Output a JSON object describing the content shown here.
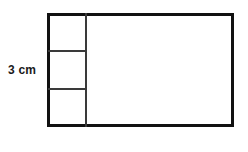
{
  "figure": {
    "type": "geometry-diagram",
    "background_color": "#ffffff",
    "stroke_color": "#111111",
    "interior_stroke_color": "#3a3a3a",
    "outer_border_width_px": 3,
    "interior_line_width_px": 2
  },
  "labels": {
    "height_label": "3 cm"
  },
  "shapes": {
    "main_rectangle": {
      "name": "main-rectangle",
      "x": 47,
      "y": 13,
      "width": 187,
      "height": 114
    },
    "column_divider": {
      "name": "column-divider",
      "orientation": "vertical",
      "x": 85,
      "y_start": 13,
      "y_end": 127
    },
    "cell_dividers": [
      {
        "name": "cell-divider-1",
        "orientation": "horizontal",
        "y": 50,
        "x_start": 48,
        "x_end": 86
      },
      {
        "name": "cell-divider-2",
        "orientation": "horizontal",
        "y": 88,
        "x_start": 48,
        "x_end": 86
      }
    ]
  },
  "regions": {
    "left_column_cells": 3,
    "right_region_label": ""
  }
}
